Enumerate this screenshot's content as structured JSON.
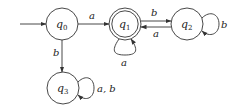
{
  "diagram": {
    "type": "finite-automaton",
    "colors": {
      "stroke": "#333333",
      "text": "#222222",
      "background": "#ffffff"
    },
    "start_state": "q0",
    "accepting_states": [
      "q1"
    ],
    "states": [
      {
        "id": "q0",
        "base": "q",
        "sub": "0",
        "cx": 62,
        "cy": 24,
        "r": 16,
        "accepting": false
      },
      {
        "id": "q1",
        "base": "q",
        "sub": "1",
        "cx": 125,
        "cy": 24,
        "r": 16,
        "accepting": true
      },
      {
        "id": "q2",
        "base": "q",
        "sub": "2",
        "cx": 187,
        "cy": 24,
        "r": 16,
        "accepting": false
      },
      {
        "id": "q3",
        "base": "q",
        "sub": "3",
        "cx": 63,
        "cy": 88,
        "r": 16,
        "accepting": false
      }
    ],
    "transitions": [
      {
        "from": "q0",
        "to": "q1",
        "label": "a"
      },
      {
        "from": "q0",
        "to": "q3",
        "label": "b"
      },
      {
        "from": "q1",
        "to": "q1",
        "label": "a"
      },
      {
        "from": "q1",
        "to": "q2",
        "label": "b"
      },
      {
        "from": "q2",
        "to": "q1",
        "label": "a"
      },
      {
        "from": "q2",
        "to": "q2",
        "label": "b"
      },
      {
        "from": "q3",
        "to": "q3",
        "label": "a, b"
      }
    ]
  }
}
